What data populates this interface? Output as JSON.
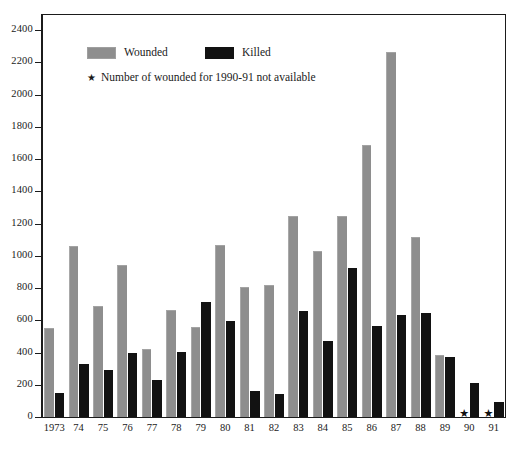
{
  "chart_data": {
    "type": "bar",
    "title": "",
    "subtitle": "",
    "xlabel": "",
    "ylabel": "",
    "ylim": [
      0,
      2500
    ],
    "yticks": [
      0,
      200,
      400,
      600,
      800,
      1000,
      1200,
      1400,
      1600,
      1800,
      2000,
      2200,
      2400
    ],
    "ytick_labels": [
      "0",
      "200",
      "400",
      "600",
      "800",
      "1000",
      "1200",
      "1400",
      "1600",
      "1800",
      "2000",
      "2200",
      "2400"
    ],
    "grid": false,
    "legend_position": "upper-left-inside",
    "categories": [
      "1973",
      "74",
      "75",
      "76",
      "77",
      "78",
      "79",
      "80",
      "81",
      "82",
      "83",
      "84",
      "85",
      "86",
      "87",
      "88",
      "89",
      "90",
      "91"
    ],
    "series": [
      {
        "name": "Wounded",
        "color": "#8e8e8e",
        "values": [
          550,
          1060,
          690,
          940,
          420,
          665,
          560,
          1070,
          805,
          820,
          1245,
          1030,
          1245,
          1690,
          2265,
          1115,
          385,
          null,
          null
        ]
      },
      {
        "name": "Killed",
        "color": "#121212",
        "values": [
          150,
          330,
          290,
          395,
          230,
          405,
          715,
          595,
          160,
          140,
          655,
          470,
          925,
          565,
          630,
          645,
          370,
          210,
          95
        ]
      }
    ],
    "annotations": [
      {
        "category": "90",
        "marker": "star",
        "note": "wounded not available"
      },
      {
        "category": "91",
        "marker": "star",
        "note": "wounded not available"
      }
    ]
  },
  "legend": {
    "wounded_label": "Wounded",
    "killed_label": "Killed",
    "note_star": "★",
    "note_text": "Number of wounded for 1990-91 not available"
  },
  "colors": {
    "wounded": "#8e8e8e",
    "killed": "#121212",
    "axis": "#1b1b1b",
    "background": "#ffffff",
    "text": "#1a1a1a"
  }
}
